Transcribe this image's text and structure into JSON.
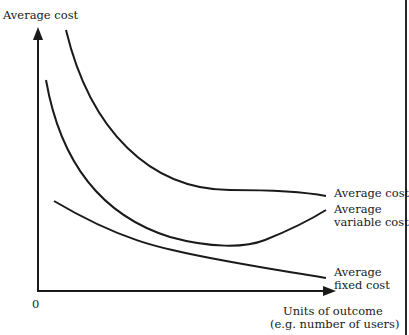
{
  "diagram": {
    "type": "cost-curves",
    "y_axis_label": "Average cost",
    "x_axis_label_line1": "Units of outcome",
    "x_axis_label_line2": "(e.g. number of users)",
    "origin_label": "0",
    "curves": [
      {
        "name": "Average cost",
        "label_lines": [
          "Average cost"
        ]
      },
      {
        "name": "Average variable cost",
        "label_lines": [
          "Average",
          "variable cost"
        ]
      },
      {
        "name": "Average fixed cost",
        "label_lines": [
          "Average",
          "fixed cost"
        ]
      }
    ],
    "line_color": "#1a1a1a"
  }
}
